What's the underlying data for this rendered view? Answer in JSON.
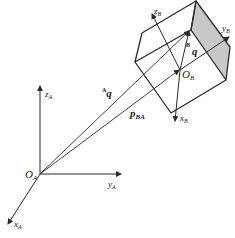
{
  "diagram": {
    "type": "coordinate-frame-transform",
    "colors": {
      "line": "#2a2a2a",
      "shaded_face": "#c8c8c8",
      "background": "#ffffff"
    },
    "frame_A": {
      "origin_label": "O",
      "origin_sub": "A",
      "axes": [
        {
          "label": "z",
          "sub": "A"
        },
        {
          "label": "y",
          "sub": "A"
        },
        {
          "label": "x",
          "sub": "A"
        }
      ]
    },
    "frame_B": {
      "origin_label": "O",
      "origin_sub": "B",
      "axes": [
        {
          "label": "z",
          "sub": "B"
        },
        {
          "label": "y",
          "sub": "B"
        },
        {
          "label": "x",
          "sub": "B"
        }
      ]
    },
    "vectors": [
      {
        "name": "A_q",
        "pre_sup": "A",
        "label": "q"
      },
      {
        "name": "p_BA",
        "label": "p",
        "sub": "BA"
      },
      {
        "name": "B_q",
        "pre_sup": "B",
        "label": "q"
      }
    ]
  }
}
